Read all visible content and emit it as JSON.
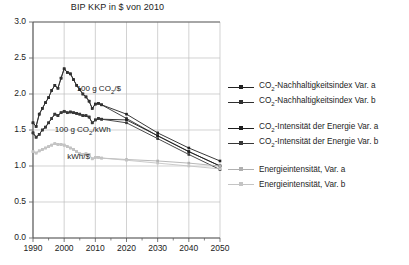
{
  "chart_data": {
    "type": "line",
    "title": "BIP KKP in $ von 2010",
    "xlabel": "",
    "ylabel": "",
    "xlim": [
      1990,
      2050
    ],
    "ylim": [
      0.0,
      3.0
    ],
    "grid": true,
    "legend_position": "right",
    "xticks": [
      "1990",
      "2000",
      "2010",
      "2020",
      "2030",
      "2040",
      "2050"
    ],
    "yticks": [
      "0.0",
      "0.5",
      "1.0",
      "1.5",
      "2.0",
      "2.5",
      "3.0"
    ],
    "annotations": [
      {
        "text": "100 g CO2/$",
        "x": 2004,
        "y": 2.06
      },
      {
        "text": "100 g CO2/kWh",
        "x": 1997,
        "y": 1.49
      },
      {
        "text": "kWh/$",
        "x": 2001,
        "y": 1.11
      }
    ],
    "x": [
      1990,
      1991,
      1992,
      1993,
      1994,
      1995,
      1996,
      1997,
      1998,
      1999,
      2000,
      2001,
      2002,
      2003,
      2004,
      2005,
      2006,
      2007,
      2008,
      2009,
      2010,
      2011,
      2012,
      2020,
      2030,
      2040,
      2050
    ],
    "series": [
      {
        "name": "CO2-Nachhaltigkeitsindex Var. a",
        "color": "#222222",
        "values": [
          1.6,
          1.55,
          1.72,
          1.8,
          1.88,
          1.95,
          2.05,
          2.12,
          2.08,
          2.22,
          2.35,
          2.3,
          2.28,
          2.2,
          2.12,
          2.06,
          2.0,
          1.96,
          1.9,
          1.8,
          1.86,
          1.87,
          1.85,
          1.72,
          1.46,
          1.25,
          1.07
        ]
      },
      {
        "name": "CO2-Nachhaltigkeitsindex Var. b",
        "color": "#303030",
        "values": [
          1.6,
          1.55,
          1.72,
          1.8,
          1.88,
          1.95,
          2.05,
          2.12,
          2.08,
          2.22,
          2.35,
          2.3,
          2.28,
          2.2,
          2.12,
          2.06,
          2.0,
          1.96,
          1.9,
          1.8,
          1.86,
          1.87,
          1.85,
          1.66,
          1.42,
          1.2,
          1.0
        ]
      },
      {
        "name": "CO2-Intensität der Energie Var. a",
        "color": "#1e1e1e",
        "values": [
          1.46,
          1.4,
          1.44,
          1.5,
          1.54,
          1.6,
          1.66,
          1.72,
          1.7,
          1.74,
          1.76,
          1.74,
          1.75,
          1.74,
          1.73,
          1.72,
          1.7,
          1.7,
          1.68,
          1.6,
          1.64,
          1.66,
          1.65,
          1.64,
          1.42,
          1.2,
          1.0
        ]
      },
      {
        "name": "CO2-Intensität der Energie Var. b",
        "color": "#383838",
        "values": [
          1.46,
          1.4,
          1.44,
          1.5,
          1.54,
          1.6,
          1.66,
          1.72,
          1.7,
          1.74,
          1.76,
          1.74,
          1.75,
          1.74,
          1.73,
          1.72,
          1.7,
          1.7,
          1.68,
          1.6,
          1.64,
          1.66,
          1.65,
          1.6,
          1.38,
          1.16,
          0.95
        ]
      },
      {
        "name": "Energieintensität, Var. a",
        "color": "#b0b0b0",
        "values": [
          1.2,
          1.18,
          1.21,
          1.23,
          1.25,
          1.27,
          1.29,
          1.31,
          1.3,
          1.3,
          1.29,
          1.27,
          1.25,
          1.23,
          1.2,
          1.17,
          1.16,
          1.17,
          1.16,
          1.1,
          1.12,
          1.12,
          1.11,
          1.09,
          1.07,
          1.04,
          1.0
        ]
      },
      {
        "name": "Energieintensität, Var. b",
        "color": "#c4c4c4",
        "values": [
          1.2,
          1.18,
          1.21,
          1.23,
          1.25,
          1.27,
          1.29,
          1.31,
          1.3,
          1.3,
          1.29,
          1.27,
          1.25,
          1.23,
          1.2,
          1.17,
          1.16,
          1.17,
          1.16,
          1.1,
          1.12,
          1.12,
          1.11,
          1.08,
          1.04,
          1.0,
          0.96
        ]
      }
    ]
  },
  "legend": {
    "entries": [
      {
        "label_pre": "CO",
        "label_sub": "2",
        "label_post": "-Nachhaltigkeitsindex Var. a",
        "color": "#222222"
      },
      {
        "label_pre": "CO",
        "label_sub": "2",
        "label_post": "-Nachhaltigkeitsindex Var. b",
        "color": "#303030"
      },
      {
        "label_pre": "CO",
        "label_sub": "2",
        "label_post": "-Intensität der Energie Var. a",
        "color": "#1e1e1e"
      },
      {
        "label_pre": "CO",
        "label_sub": "2",
        "label_post": "-Intensität der Energie Var. b",
        "color": "#383838"
      },
      {
        "label_pre": "Energieintensität, Var. a",
        "label_sub": "",
        "label_post": "",
        "color": "#b0b0b0"
      },
      {
        "label_pre": "Energieintensität, Var. b",
        "label_sub": "",
        "label_post": "",
        "color": "#c4c4c4"
      }
    ]
  },
  "annotations": {
    "a1_pre": "100 g CO",
    "a1_sub": "2",
    "a1_post": "/$",
    "a2_pre": "100 g CO",
    "a2_sub": "2",
    "a2_post": "/kWh",
    "a3_pre": "kWh/$",
    "a3_sub": "",
    "a3_post": ""
  },
  "colors": {
    "axis": "#555555",
    "grid": "#bfbfbf",
    "background": "#ffffff",
    "text": "#1a1a1a"
  }
}
